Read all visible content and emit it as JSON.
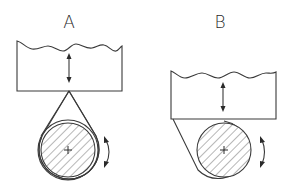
{
  "diagrams": [
    {
      "id": "A",
      "label": "A",
      "block": {
        "left": 17,
        "right": 122,
        "top": 40,
        "bottom": 91,
        "wavy_top": true
      },
      "block_arrow": "vertical-double-arrow",
      "belt": "teardrop-wrap",
      "roller": {
        "cx": 68,
        "cy": 150,
        "r_inner": 27,
        "r_outer": 30,
        "hatched": true,
        "center_mark": "+"
      },
      "rotation_arrow": "curved-double-arrow"
    },
    {
      "id": "B",
      "label": "B",
      "block": {
        "left": 171,
        "right": 276,
        "top": 70,
        "bottom": 119,
        "wavy_top": true
      },
      "block_arrow": "vertical-double-arrow",
      "belt": "side-wrap",
      "roller": {
        "cx": 224,
        "cy": 150,
        "r_inner": 27,
        "r_outer": 29,
        "hatched": true,
        "center_mark": "+"
      },
      "rotation_arrow": "curved-double-arrow"
    }
  ],
  "colors": {
    "line": "#3a3a3a",
    "background": "#ffffff"
  }
}
